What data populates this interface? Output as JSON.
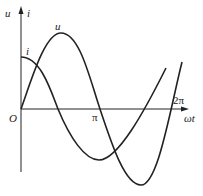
{
  "diagram": {
    "title": "",
    "axes": {
      "y_labels": [
        "u",
        "i"
      ],
      "x_label": "ωt",
      "origin_label": "O",
      "ticks": [
        {
          "label": "π"
        },
        {
          "label": "2π"
        }
      ]
    },
    "curves": [
      {
        "name": "u",
        "label": "u",
        "shape": "sin"
      },
      {
        "name": "i",
        "label": "i",
        "shape": "cos (leads u)"
      }
    ],
    "colors": {
      "stroke": "#222222",
      "background": "#ffffff"
    }
  }
}
